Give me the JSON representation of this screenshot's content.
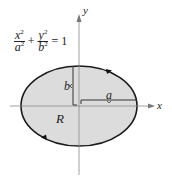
{
  "equation": {
    "term1": {
      "numerator": "x",
      "denominator": "a",
      "exponent": "2"
    },
    "plus": "+",
    "term2": {
      "numerator": "y",
      "denominator": "b",
      "exponent": "2"
    },
    "equals": "= 1"
  },
  "axes": {
    "x_label": "x",
    "y_label": "y"
  },
  "labels": {
    "semi_major": "a",
    "semi_minor": "b",
    "region": "R"
  },
  "colors": {
    "fill": "#d9d9d9",
    "stroke": "#1a1a1a",
    "axis": "#888888"
  }
}
